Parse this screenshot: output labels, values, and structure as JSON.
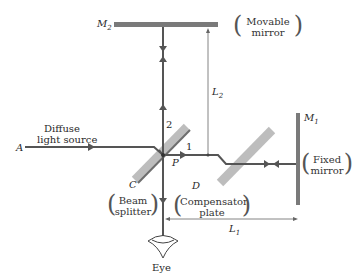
{
  "diagram": {
    "type": "Michelson interferometer",
    "labels": {
      "m2": "M",
      "m2_sub": "2",
      "m1": "M",
      "m1_sub": "1",
      "movable_mirror_line1": "Movable",
      "movable_mirror_line2": "mirror",
      "fixed_mirror_line1": "Fixed",
      "fixed_mirror_line2": "mirror",
      "source_line1": "Diffuse",
      "source_line2": "light source",
      "point_a": "A",
      "point_p": "P",
      "point_c": "C",
      "point_d": "D",
      "beam_1": "1",
      "beam_2": "2",
      "beam_splitter_line1": "Beam",
      "beam_splitter_line2": "splitter",
      "compensator_line1": "Compensator",
      "compensator_line2": "plate",
      "l1": "L",
      "l1_sub": "1",
      "l2": "L",
      "l2_sub": "2",
      "eye": "Eye"
    },
    "colors": {
      "beam": "#555555",
      "mirror": "#7a7a7a",
      "plate": "#bdbdbd",
      "dimension": "#666666"
    }
  }
}
